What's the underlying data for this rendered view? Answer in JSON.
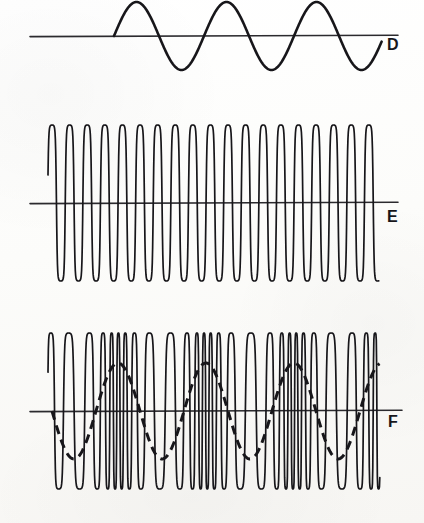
{
  "figure": {
    "background_color": "#fbfbf9",
    "ink_color": "#17161a",
    "panels": [
      {
        "id": "D",
        "label": "D",
        "label_x": 387,
        "label_y": 37,
        "description": "modulating sine wave",
        "baseline_y": 36,
        "baseline_x_start": 30,
        "baseline_x_end": 398,
        "wave_x_start": 114,
        "wave_x_end": 382,
        "amplitude": 34,
        "period": 90,
        "cycles": 3,
        "clipped_top": true,
        "line_width": 2.6,
        "style": "solid"
      },
      {
        "id": "E",
        "label": "E",
        "label_x": 387,
        "label_y": 209,
        "description": "unmodulated carrier wave of constant frequency and amplitude",
        "baseline_y": 203,
        "baseline_x_start": 30,
        "baseline_x_end": 398,
        "wave_x_start": 48,
        "wave_x_end": 379,
        "amplitude": 78,
        "period": 17.6,
        "cycles": 19,
        "line_width": 1.7,
        "style": "solid"
      },
      {
        "id": "F",
        "label": "F",
        "label_x": 388,
        "label_y": 414,
        "description": "frequency modulated carrier wave with dashed modulating envelope",
        "baseline_y": 411,
        "baseline_x_start": 30,
        "baseline_x_end": 402,
        "wave_x_start": 48,
        "wave_x_end": 380,
        "amplitude": 78,
        "carrier_period_center": 12.5,
        "carrier_period_min": 6.5,
        "carrier_period_max": 22.0,
        "line_width": 1.7,
        "style": "solid",
        "modulating_overlay": {
          "visible": true,
          "style": "dashed",
          "dash_pattern": "9,6",
          "amplitude": 48,
          "period": 88,
          "phase_x": 96,
          "x_start": 52,
          "x_end": 380,
          "line_width": 3.0
        }
      }
    ]
  },
  "chart_data": {
    "type": "line",
    "title": "",
    "xlabel": "",
    "ylabel": "",
    "grid": false,
    "legend_position": "right",
    "series": [
      {
        "name": "D",
        "waveform": "sine",
        "role": "modulating signal",
        "amplitude": 1.0,
        "frequency_relative": 1,
        "cycles": 3,
        "baseline": 0,
        "annotation": "D"
      },
      {
        "name": "E",
        "waveform": "sine",
        "role": "unmodulated carrier",
        "amplitude": 1.0,
        "frequency_relative": 19,
        "cycles": 19,
        "baseline": 0,
        "annotation": "E"
      },
      {
        "name": "F",
        "waveform": "frequency-modulated sine",
        "role": "frequency modulated carrier",
        "amplitude": 1.0,
        "frequency_relative_center": 26,
        "frequency_deviation": 0.62,
        "modulation_cycles": 3,
        "baseline": 0,
        "annotation": "F"
      },
      {
        "name": "F-envelope",
        "waveform": "sine (dashed)",
        "role": "modulating signal overlay on F",
        "amplitude": 0.62,
        "frequency_relative": 3,
        "cycles": 3,
        "baseline": 0,
        "annotation": ""
      }
    ]
  }
}
